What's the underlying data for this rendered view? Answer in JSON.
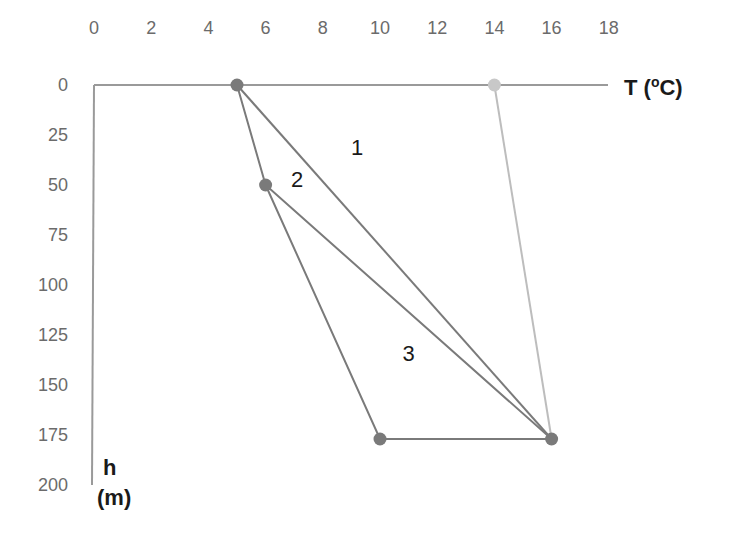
{
  "chart_data": {
    "type": "line",
    "title": "",
    "xlabel": "T (oC)",
    "xlabel_parts": {
      "main": "T (",
      "sup": "o",
      "end": "C)"
    },
    "ylabel_line1": "h",
    "ylabel_line2": "(m)",
    "x_axis_position": "top",
    "y_axis_inverted": true,
    "xlim": [
      0,
      18
    ],
    "ylim": [
      0,
      200
    ],
    "x_ticks": [
      0,
      2,
      4,
      6,
      8,
      10,
      12,
      14,
      16,
      18
    ],
    "y_ticks": [
      0,
      25,
      50,
      75,
      100,
      125,
      150,
      175,
      200
    ],
    "grid": false,
    "series": [
      {
        "name": "profile-1",
        "color": "#7a7a7a",
        "points": [
          [
            5,
            0
          ],
          [
            16,
            177
          ]
        ]
      },
      {
        "name": "profile-2",
        "color": "#7a7a7a",
        "points": [
          [
            5,
            0
          ],
          [
            6,
            50
          ],
          [
            16,
            177
          ]
        ]
      },
      {
        "name": "profile-3",
        "color": "#7a7a7a",
        "points": [
          [
            6,
            50
          ],
          [
            10,
            177
          ],
          [
            16,
            177
          ]
        ]
      },
      {
        "name": "light-profile",
        "color": "#bdbdbd",
        "points": [
          [
            14,
            0
          ],
          [
            16,
            177
          ]
        ]
      }
    ],
    "markers": [
      {
        "x": 5,
        "y": 0,
        "color": "#7a7a7a"
      },
      {
        "x": 6,
        "y": 50,
        "color": "#7a7a7a"
      },
      {
        "x": 10,
        "y": 177,
        "color": "#7a7a7a"
      },
      {
        "x": 16,
        "y": 177,
        "color": "#7a7a7a"
      },
      {
        "x": 14,
        "y": 0,
        "color": "#c8c8c8"
      }
    ],
    "annotations": [
      {
        "text": "1",
        "x": 9.2,
        "y": 35
      },
      {
        "text": "2",
        "x": 7.1,
        "y": 51
      },
      {
        "text": "3",
        "x": 11.0,
        "y": 138
      }
    ]
  }
}
